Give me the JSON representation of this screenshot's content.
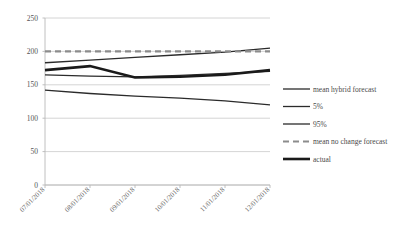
{
  "chart_data": {
    "type": "line",
    "title": "",
    "xlabel": "",
    "ylabel": "",
    "grid": true,
    "legend_position": "right",
    "ylim": [
      0,
      250
    ],
    "yticks": [
      0,
      50,
      100,
      150,
      200,
      250
    ],
    "ytick_labels": [
      "0",
      "50",
      "100",
      "150",
      "200",
      "250"
    ],
    "categories": [
      "07/01/2018",
      "08/01/2018",
      "09/01/2018",
      "10/01/2018",
      "11/01/2018",
      "12/01/2018"
    ],
    "series": [
      {
        "name": "mean hybrid forecast",
        "color": "#2b2b2b",
        "width": 1.3,
        "dash": "none",
        "values": [
          165,
          163,
          162,
          164,
          167,
          170
        ]
      },
      {
        "name": "5%",
        "color": "#2b2b2b",
        "width": 1.3,
        "dash": "none",
        "values": [
          142,
          137,
          133,
          130,
          126,
          120
        ]
      },
      {
        "name": "95%",
        "color": "#2b2b2b",
        "width": 1.3,
        "dash": "none",
        "values": [
          183,
          187,
          191,
          195,
          199,
          205
        ]
      },
      {
        "name": "mean no change forecast",
        "color": "#8c8c8c",
        "width": 2.2,
        "dash": "6,4",
        "values": [
          200,
          200,
          200,
          200,
          200,
          200
        ]
      },
      {
        "name": "actual",
        "color": "#1a1a1a",
        "width": 2.6,
        "dash": "none",
        "values": [
          172,
          178,
          161,
          162,
          165,
          172
        ]
      }
    ]
  },
  "legend": {
    "items": [
      {
        "label": "mean hybrid forecast",
        "color": "#2b2b2b",
        "width": 1.3,
        "dash": "none"
      },
      {
        "label": "5%",
        "color": "#2b2b2b",
        "width": 1.3,
        "dash": "none"
      },
      {
        "label": "95%",
        "color": "#2b2b2b",
        "width": 1.3,
        "dash": "none"
      },
      {
        "label": "mean no change forecast",
        "color": "#8c8c8c",
        "width": 2.2,
        "dash": "6,4"
      },
      {
        "label": "actual",
        "color": "#1a1a1a",
        "width": 2.6,
        "dash": "none"
      }
    ]
  },
  "axes": {
    "y_label_x": 38,
    "plot_left": 45,
    "plot_right": 270,
    "plot_top": 18,
    "plot_bottom": 185
  }
}
